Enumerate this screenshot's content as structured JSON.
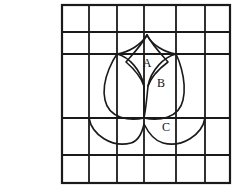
{
  "figure": {
    "caption": "Fig. 4",
    "caption_position": {
      "x": 5,
      "y": 13
    },
    "background_color": "#ffffff",
    "ink_color": "#1a1a1a"
  },
  "grid": {
    "bounds": {
      "left": 62,
      "top": 5,
      "right": 230,
      "bottom": 183
    },
    "vertical_lines_x": [
      62,
      89,
      117,
      144,
      176,
      205,
      230
    ],
    "horizontal_lines_y": [
      5,
      32,
      54,
      118,
      155,
      183
    ],
    "outer_stroke_width": 2.2,
    "inner_stroke_width": 1.8,
    "columns": 6,
    "rows": 5
  },
  "shape": {
    "name": "tulip-flower",
    "stroke_width": 1.6,
    "outer_petal_path": "M 117 54 C 117 54 100 78 105 100 C 109 119 130 121 144 118 C 158 121 179 119 183 100 C 188 78 176 54 176 54",
    "left_petal_path": "M 117 54 C 129 57 141 70 144 86 C 144 96 144 108 144 118",
    "right_petal_path": "M 176 54 C 164 57 151 70 148 86 C 147 97 146 108 144 118",
    "top_petal_left_path": "M 117 54 C 129 52 141 45 147 35",
    "top_petal_right_path": "M 176 54 C 164 52 152 45 147 35",
    "top_petal_inner_left_path": "M 147 35 C 141 46 132 55 126 62 C 133 68 141 77 144 86",
    "top_petal_inner_right_path": "M 147 35 C 153 46 162 55 168 62 C 160 68 151 77 148 86",
    "leaf_left_path": "M 89 118 C 92 135 112 148 131 143 C 138 141 142 133 144 124",
    "leaf_right_path": "M 205 118 C 202 135 182 148 163 143 C 155 141 148 132 144 124"
  },
  "regions": [
    {
      "id": "A",
      "label": "A",
      "x": 147,
      "y": 64
    },
    {
      "id": "B",
      "label": "B",
      "x": 161,
      "y": 84
    },
    {
      "id": "C",
      "label": "C",
      "x": 166,
      "y": 128
    }
  ]
}
